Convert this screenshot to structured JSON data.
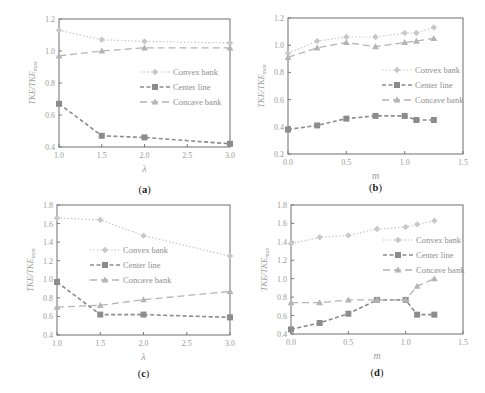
{
  "figure": {
    "legend_labels": [
      "Convex bank",
      "Center line",
      "Concave bank"
    ],
    "y_label_main": "TKE/TKE",
    "y_label_sub": "max",
    "colors": {
      "axis": "#7a7a7a",
      "convex": "#c8c8c8",
      "center": "#8c8c8c",
      "concave": "#b4b4b4",
      "tick_text": "#9a9a9a"
    }
  },
  "chart_data": [
    {
      "type": "line",
      "panel": "(a)",
      "caption_letter": "a",
      "xlabel": "λ",
      "ylabel": "TKE/TKE_max",
      "x": [
        1.0,
        1.5,
        2.0,
        3.0
      ],
      "xticks": [
        "1.0",
        "1.5",
        "2.0",
        "2.5",
        "3.0"
      ],
      "xlim": [
        1.0,
        3.0
      ],
      "yticks": [
        "0.4",
        "0.6",
        "0.8",
        "1.0",
        "1.2"
      ],
      "ylim": [
        0.4,
        1.2
      ],
      "grid": false,
      "legend_position": "center-right",
      "series": [
        {
          "name": "Convex bank",
          "values": [
            1.13,
            1.07,
            1.06,
            1.05
          ]
        },
        {
          "name": "Center line",
          "values": [
            0.67,
            0.47,
            0.46,
            0.42
          ]
        },
        {
          "name": "Concave bank",
          "values": [
            0.97,
            1.0,
            1.02,
            1.02
          ]
        }
      ]
    },
    {
      "type": "line",
      "panel": "(b)",
      "caption_letter": "b",
      "xlabel": "m",
      "ylabel": "TKE/TKE_max",
      "x": [
        0.0,
        0.25,
        0.5,
        0.75,
        1.0,
        1.1,
        1.25
      ],
      "xticks": [
        "0.0",
        "0.5",
        "1.0",
        "1.5"
      ],
      "xlim": [
        0.0,
        1.5
      ],
      "yticks": [
        "0.2",
        "0.4",
        "0.6",
        "0.8",
        "1.0",
        "1.2"
      ],
      "ylim": [
        0.2,
        1.2
      ],
      "grid": false,
      "legend_position": "center-right",
      "series": [
        {
          "name": "Convex bank",
          "values": [
            0.94,
            1.03,
            1.06,
            1.06,
            1.09,
            1.09,
            1.13
          ]
        },
        {
          "name": "Center line",
          "values": [
            0.38,
            0.41,
            0.46,
            0.48,
            0.48,
            0.45,
            0.45
          ]
        },
        {
          "name": "Concave bank",
          "values": [
            0.91,
            0.98,
            1.02,
            0.99,
            1.02,
            1.03,
            1.05
          ]
        }
      ]
    },
    {
      "type": "line",
      "panel": "(c)",
      "caption_letter": "c",
      "xlabel": "λ",
      "ylabel": "TKE/TKE_max",
      "x": [
        1.0,
        1.5,
        2.0,
        3.0
      ],
      "xticks": [
        "1.0",
        "1.5",
        "2.0",
        "2.5",
        "3.0"
      ],
      "xlim": [
        1.0,
        3.0
      ],
      "yticks": [
        "0.4",
        "0.6",
        "0.8",
        "1.0",
        "1.2",
        "1.4",
        "1.6",
        "1.8"
      ],
      "ylim": [
        0.4,
        1.8
      ],
      "grid": false,
      "legend_position": "center",
      "series": [
        {
          "name": "Convex bank",
          "values": [
            1.66,
            1.64,
            1.47,
            1.25
          ]
        },
        {
          "name": "Center line",
          "values": [
            0.97,
            0.62,
            0.62,
            0.59
          ]
        },
        {
          "name": "Concave bank",
          "values": [
            0.7,
            0.72,
            0.78,
            0.87
          ]
        }
      ]
    },
    {
      "type": "line",
      "panel": "(d)",
      "caption_letter": "d",
      "xlabel": "m",
      "ylabel": "TKE/TKE_max",
      "x": [
        0.0,
        0.25,
        0.5,
        0.75,
        1.0,
        1.1,
        1.25
      ],
      "xticks": [
        "0.0",
        "0.5",
        "1.0",
        "1.5"
      ],
      "xlim": [
        0.0,
        1.5
      ],
      "yticks": [
        "0.4",
        "0.6",
        "0.8",
        "1.0",
        "1.2",
        "1.4",
        "1.6",
        "1.8"
      ],
      "ylim": [
        0.4,
        1.8
      ],
      "grid": false,
      "legend_position": "center-right",
      "series": [
        {
          "name": "Convex bank",
          "values": [
            1.38,
            1.45,
            1.47,
            1.54,
            1.56,
            1.59,
            1.63
          ]
        },
        {
          "name": "Center line",
          "values": [
            0.45,
            0.52,
            0.62,
            0.77,
            0.77,
            0.61,
            0.61
          ]
        },
        {
          "name": "Concave bank",
          "values": [
            0.74,
            0.74,
            0.77,
            0.77,
            0.77,
            0.92,
            1.0
          ]
        }
      ]
    }
  ],
  "layout": {
    "panels": [
      {
        "box": [
          59,
          19,
          230,
          147
        ],
        "legend": [
          140,
          72
        ],
        "caption_y": 193
      },
      {
        "box": [
          288,
          18,
          463,
          154
        ],
        "legend": [
          382,
          70
        ],
        "caption_y": 191
      },
      {
        "box": [
          57,
          205,
          230,
          335
        ],
        "legend": [
          90,
          250
        ],
        "caption_y": 377
      },
      {
        "box": [
          291,
          205,
          463,
          334
        ],
        "legend": [
          383,
          240
        ],
        "caption_y": 376
      }
    ]
  }
}
